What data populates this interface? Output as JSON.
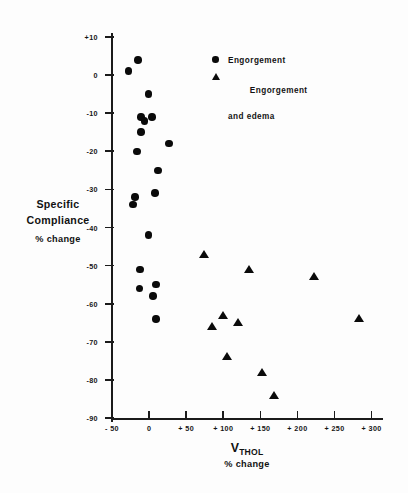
{
  "chart_data": {
    "type": "scatter",
    "title": "",
    "xlabel": "V_THO,L % change",
    "xlabel_main": "V",
    "xlabel_sub1": "THO",
    "xlabel_sub2": "L",
    "xlabel_units": "% change",
    "ylabel_line1": "Specific",
    "ylabel_line2": "Compliance",
    "ylabel_units": "% change",
    "xlim": [
      -50,
      314
    ],
    "ylim": [
      -90,
      10
    ],
    "xticks": [
      -50,
      0,
      50,
      100,
      150,
      200,
      250,
      300
    ],
    "xticklabels": [
      "- 50",
      "0",
      "+ 50",
      "+ 100",
      "+ 150",
      "+ 200",
      "+ 250",
      "+ 300"
    ],
    "yticks": [
      10,
      0,
      -10,
      -20,
      -30,
      -40,
      -50,
      -60,
      -70,
      -80,
      -90
    ],
    "yticklabels": [
      "+10",
      "0",
      "-10",
      "-20",
      "-30",
      "-40",
      "-50",
      "-60",
      "-70",
      "-80",
      "-90"
    ],
    "grid": false,
    "legend_position": "upper-right",
    "series": [
      {
        "name": "Engorgement",
        "marker": "circle",
        "color": "#0a0a0a",
        "points": [
          {
            "x": -28,
            "y": 1
          },
          {
            "x": -15,
            "y": 4
          },
          {
            "x": -1,
            "y": -5
          },
          {
            "x": -11,
            "y": -11
          },
          {
            "x": -6,
            "y": -12
          },
          {
            "x": 4,
            "y": -11
          },
          {
            "x": -11,
            "y": -15
          },
          {
            "x": 27,
            "y": -18
          },
          {
            "x": -16,
            "y": -20
          },
          {
            "x": 12,
            "y": -25
          },
          {
            "x": -19,
            "y": -32
          },
          {
            "x": 8,
            "y": -31
          },
          {
            "x": -22,
            "y": -34
          },
          {
            "x": -1,
            "y": -42
          },
          {
            "x": -12,
            "y": -51
          },
          {
            "x": -13,
            "y": -56
          },
          {
            "x": 9,
            "y": -55
          },
          {
            "x": 5,
            "y": -58
          },
          {
            "x": 9,
            "y": -64
          }
        ]
      },
      {
        "name": "Engorgement and edema",
        "marker": "triangle",
        "color": "#0a0a0a",
        "points": [
          {
            "x": 74,
            "y": -47
          },
          {
            "x": 135,
            "y": -51
          },
          {
            "x": 222,
            "y": -53
          },
          {
            "x": 85,
            "y": -66
          },
          {
            "x": 100,
            "y": -63
          },
          {
            "x": 120,
            "y": -65
          },
          {
            "x": 105,
            "y": -74
          },
          {
            "x": 152,
            "y": -78
          },
          {
            "x": 168,
            "y": -84
          },
          {
            "x": 283,
            "y": -64
          }
        ]
      }
    ],
    "legend": [
      {
        "marker": "circle",
        "label": "Engorgement",
        "label2": ""
      },
      {
        "marker": "triangle",
        "label": "Engorgement",
        "label2": "and edema"
      }
    ]
  }
}
